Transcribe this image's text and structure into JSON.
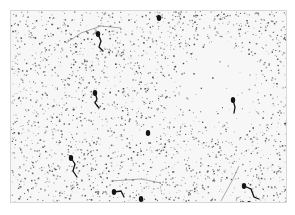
{
  "image": {
    "description": "Grayscale micrograph of sperm-like cells on a dense speckled background",
    "frame": {
      "x": 10,
      "y": 10,
      "width": 277,
      "height": 193
    },
    "background_color": "#f7f7f7",
    "speckle_color": "#3a3a3a",
    "cell_color": "#141414",
    "clear_region": {
      "cx": 208,
      "cy": 72,
      "r": 38
    },
    "cells": [
      {
        "head": [
          87,
          23
        ],
        "tail": [
          [
            87,
            23
          ],
          [
            90,
            30
          ],
          [
            88,
            36
          ],
          [
            92,
            40
          ]
        ]
      },
      {
        "head": [
          84,
          82
        ],
        "tail": [
          [
            84,
            82
          ],
          [
            86,
            88
          ],
          [
            84,
            92
          ],
          [
            88,
            97
          ]
        ]
      },
      {
        "head": [
          60,
          147
        ],
        "tail": [
          [
            60,
            147
          ],
          [
            64,
            153
          ],
          [
            62,
            160
          ],
          [
            66,
            166
          ]
        ]
      },
      {
        "head": [
          103,
          181
        ],
        "tail": [
          [
            103,
            181
          ],
          [
            110,
            180
          ],
          [
            113,
            186
          ]
        ]
      },
      {
        "head": [
          130,
          188
        ],
        "tail": []
      },
      {
        "head": [
          222,
          89
        ],
        "tail": [
          [
            222,
            89
          ],
          [
            224,
            96
          ],
          [
            223,
            102
          ]
        ]
      },
      {
        "head": [
          233,
          175
        ],
        "tail": [
          [
            233,
            175
          ],
          [
            240,
            178
          ],
          [
            243,
            186
          ],
          [
            248,
            188
          ]
        ]
      },
      {
        "head": [
          238,
          193
        ],
        "tail": []
      },
      {
        "head": [
          148,
          7
        ],
        "tail": []
      },
      {
        "head": [
          137,
          122
        ],
        "tail": []
      }
    ],
    "fibers": [
      [
        [
          55,
          32
        ],
        [
          70,
          22
        ],
        [
          90,
          15
        ],
        [
          110,
          17
        ]
      ],
      [
        [
          210,
          190
        ],
        [
          222,
          168
        ],
        [
          228,
          155
        ]
      ],
      [
        [
          100,
          170
        ],
        [
          130,
          168
        ],
        [
          150,
          172
        ]
      ]
    ]
  }
}
